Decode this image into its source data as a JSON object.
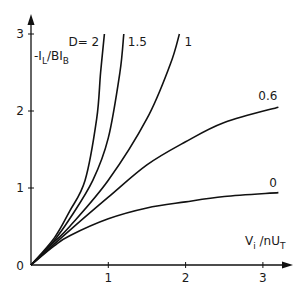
{
  "chart_data": {
    "type": "line",
    "title": "",
    "xlabel": "V_i / nU_T",
    "ylabel": "-I_L / B I_B",
    "xlim": [
      0,
      3.3
    ],
    "ylim": [
      0,
      3.15
    ],
    "x_ticks": [
      "1",
      "2",
      "3"
    ],
    "y_ticks": [
      "0",
      "1",
      "2",
      "3"
    ],
    "grid": false,
    "legend": "inline labels at curve ends",
    "series": [
      {
        "name": "D = 2",
        "label": "D= 2",
        "x": [
          0,
          0.3,
          0.5,
          0.7,
          0.85,
          0.9,
          0.95
        ],
        "y": [
          0,
          0.35,
          0.7,
          1.1,
          1.9,
          2.5,
          3.0
        ]
      },
      {
        "name": "D = 1.5",
        "label": "1.5",
        "x": [
          0,
          0.3,
          0.5,
          0.8,
          1.0,
          1.15,
          1.2
        ],
        "y": [
          0,
          0.32,
          0.6,
          1.1,
          1.65,
          2.5,
          3.0
        ]
      },
      {
        "name": "D = 1",
        "label": "1",
        "x": [
          0,
          0.3,
          0.5,
          1.0,
          1.5,
          1.8,
          1.92
        ],
        "y": [
          0,
          0.3,
          0.5,
          1.1,
          1.9,
          2.6,
          3.0
        ]
      },
      {
        "name": "D = 0.6",
        "label": "0.6",
        "x": [
          0,
          0.3,
          0.5,
          1.0,
          1.5,
          2.0,
          2.5,
          3.2
        ],
        "y": [
          0,
          0.27,
          0.45,
          0.88,
          1.3,
          1.6,
          1.85,
          2.05
        ]
      },
      {
        "name": "D = 0",
        "label": "0",
        "x": [
          0,
          0.3,
          0.5,
          1.0,
          1.5,
          2.0,
          2.5,
          3.2
        ],
        "y": [
          0,
          0.25,
          0.38,
          0.6,
          0.74,
          0.82,
          0.89,
          0.94
        ]
      }
    ]
  },
  "labels": {
    "y_axis_main": "-I",
    "y_axis_sub1": "L",
    "y_axis_mid": "/BI",
    "y_axis_sub2": "B",
    "x_axis_main": "V",
    "x_axis_sub1": "i",
    "x_axis_mid": " /nU",
    "x_axis_sub2": "T",
    "origin": "0"
  }
}
